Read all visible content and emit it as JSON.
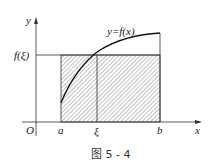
{
  "figure": {
    "caption": "图 5 - 4",
    "axes": {
      "x_label": "x",
      "y_label": "y",
      "origin_label": "O"
    },
    "curve_label": "y=f(x)",
    "level_label": "f(ξ)",
    "x_ticks": {
      "a": "a",
      "xi": "ξ",
      "b": "b"
    }
  },
  "colors": {
    "line": "#222222",
    "hatch": "#555555",
    "background": "#ffffff"
  }
}
